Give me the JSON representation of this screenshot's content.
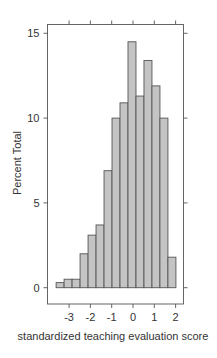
{
  "chart_data": {
    "type": "bar",
    "subtype": "histogram",
    "title": "",
    "xlabel": "standardized teaching evaluation score",
    "ylabel": "Percent Total",
    "bin_start": -3.61,
    "bin_width": 0.375,
    "bins": [
      {
        "x0": -3.61,
        "x1": -3.235,
        "value": 0.3
      },
      {
        "x0": -3.235,
        "x1": -2.86,
        "value": 0.5
      },
      {
        "x0": -2.86,
        "x1": -2.485,
        "value": 0.5
      },
      {
        "x0": -2.485,
        "x1": -2.11,
        "value": 2.0
      },
      {
        "x0": -2.11,
        "x1": -1.735,
        "value": 3.1
      },
      {
        "x0": -1.735,
        "x1": -1.36,
        "value": 3.7
      },
      {
        "x0": -1.36,
        "x1": -0.985,
        "value": 6.9
      },
      {
        "x0": -0.985,
        "x1": -0.61,
        "value": 10.0
      },
      {
        "x0": -0.61,
        "x1": -0.235,
        "value": 10.9
      },
      {
        "x0": -0.235,
        "x1": 0.14,
        "value": 14.5
      },
      {
        "x0": 0.14,
        "x1": 0.515,
        "value": 11.3
      },
      {
        "x0": 0.515,
        "x1": 0.89,
        "value": 13.4
      },
      {
        "x0": 0.89,
        "x1": 1.265,
        "value": 11.9
      },
      {
        "x0": 1.265,
        "x1": 1.64,
        "value": 10.0
      },
      {
        "x0": 1.64,
        "x1": 2.015,
        "value": 1.8
      }
    ],
    "x_ticks": [
      -3,
      -2,
      -1,
      0,
      1,
      2
    ],
    "x_tick_labels": [
      "-3",
      "-2",
      "-1",
      "0",
      "1",
      "2"
    ],
    "y_ticks": [
      0,
      5,
      10,
      15
    ],
    "y_tick_labels": [
      "0",
      "5",
      "10",
      "15"
    ],
    "xlim": [
      -4.02,
      2.36
    ],
    "ylim": [
      -0.95,
      15.55
    ],
    "grid": false,
    "legend": null,
    "colors": {
      "bar_fill": "#c4c4c4",
      "bar_stroke": "#555555",
      "axis": "#555555",
      "text": "#333333"
    }
  }
}
